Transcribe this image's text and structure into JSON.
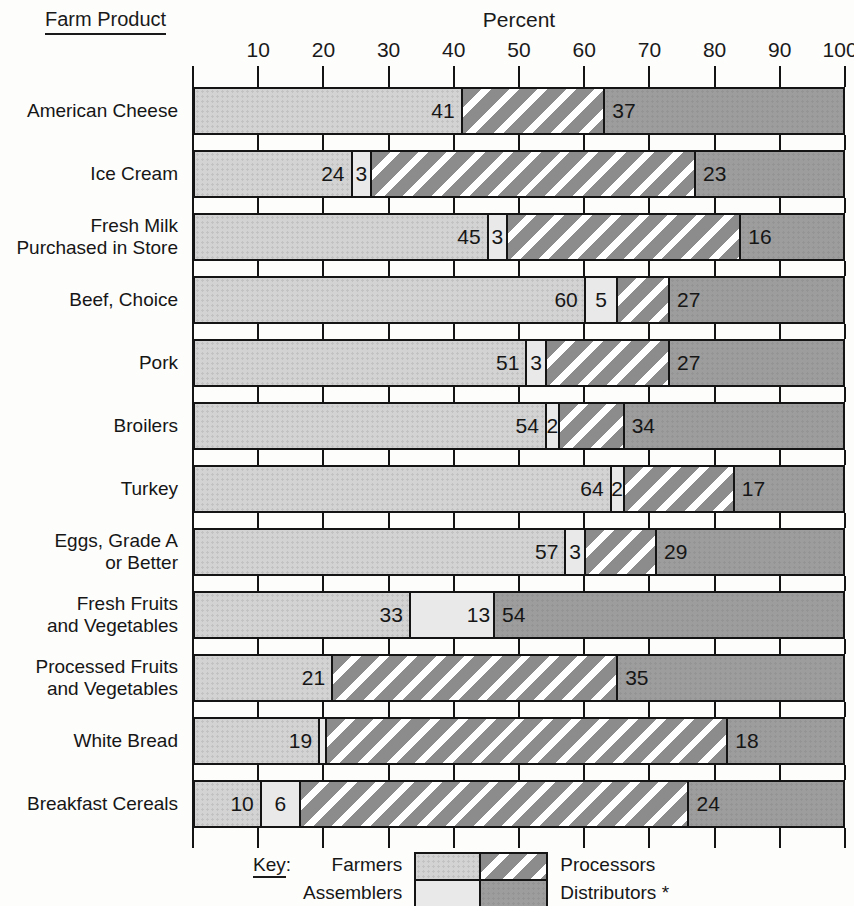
{
  "header": {
    "left_title": "Farm Product",
    "axis_title": "Percent"
  },
  "chart_data": {
    "type": "bar",
    "subtype": "horizontal-stacked",
    "unit": "percent",
    "xlabel": "Percent",
    "xlim": [
      0,
      100
    ],
    "x_ticks": [
      10,
      20,
      30,
      40,
      50,
      60,
      70,
      80,
      90,
      100
    ],
    "grid": "brick-pattern-between-bars",
    "categories": [
      "American Cheese",
      "Ice Cream",
      "Fresh Milk\nPurchased in Store",
      "Beef, Choice",
      "Pork",
      "Broilers",
      "Turkey",
      "Eggs, Grade A\nor Better",
      "Fresh Fruits\nand Vegetables",
      "Processed Fruits\nand Vegetables",
      "White Bread",
      "Breakfast Cereals"
    ],
    "series": [
      {
        "name": "Farmers",
        "key": "farmers",
        "color": "#d3d3d3",
        "pattern": "stipple",
        "values": [
          41,
          24,
          45,
          60,
          51,
          54,
          64,
          57,
          33,
          21,
          19,
          10
        ]
      },
      {
        "name": "Assemblers",
        "key": "assemblers",
        "color": "#e9e9e9",
        "pattern": "solid",
        "values": [
          0,
          3,
          3,
          5,
          3,
          2,
          2,
          3,
          13,
          0,
          1,
          6
        ]
      },
      {
        "name": "Processors",
        "key": "processors",
        "color": "#8c8c8c",
        "pattern": "white-diagonal-stripes",
        "values": [
          22,
          50,
          36,
          8,
          19,
          10,
          17,
          11,
          0,
          44,
          62,
          60
        ]
      },
      {
        "name": "Distributors *",
        "key": "distributors",
        "color": "#9d9d9d",
        "pattern": "solid",
        "values": [
          37,
          23,
          16,
          27,
          27,
          34,
          17,
          29,
          54,
          35,
          18,
          24
        ]
      }
    ],
    "segment_labels": [
      {
        "farmers": "41",
        "assemblers": null,
        "distributors": "37"
      },
      {
        "farmers": "24",
        "assemblers": "3",
        "distributors": "23"
      },
      {
        "farmers": "45",
        "assemblers": "3",
        "distributors": "16"
      },
      {
        "farmers": "60",
        "assemblers": "5",
        "distributors": "27"
      },
      {
        "farmers": "51",
        "assemblers": "3",
        "distributors": "27"
      },
      {
        "farmers": "54",
        "assemblers": "2",
        "distributors": "34"
      },
      {
        "farmers": "64",
        "assemblers": "2",
        "distributors": "17"
      },
      {
        "farmers": "57",
        "assemblers": "3",
        "distributors": "29"
      },
      {
        "farmers": "33",
        "assemblers": "13",
        "distributors": "54"
      },
      {
        "farmers": "21",
        "assemblers": null,
        "distributors": "35"
      },
      {
        "farmers": "19",
        "assemblers": null,
        "distributors": "18"
      },
      {
        "farmers": "10",
        "assemblers": "6",
        "distributors": "24"
      }
    ]
  },
  "legend": {
    "key_word": "Key",
    "key_colon": ":",
    "entries": [
      {
        "label": "Farmers"
      },
      {
        "label": "Assemblers"
      },
      {
        "label": "Processors"
      },
      {
        "label": "Distributors *"
      }
    ]
  },
  "colors": {
    "line": "#141414",
    "text": "#161616",
    "farmers": "#d3d3d3",
    "assemblers": "#e9e9e9",
    "processors_base": "#8c8c8c",
    "processors_stripe": "#ffffff",
    "distributors": "#9d9d9d",
    "background": "#fdfdfc"
  }
}
